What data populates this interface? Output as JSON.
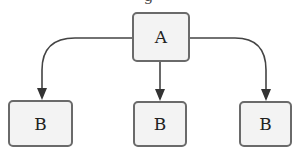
{
  "diagram": {
    "title_fragment": "g",
    "root": {
      "label": "A"
    },
    "children": [
      {
        "label": "B"
      },
      {
        "label": "B"
      },
      {
        "label": "B"
      }
    ],
    "colors": {
      "node_border": "#6a6a6a",
      "node_fill": "#f3f3f3",
      "edge": "#444444"
    }
  }
}
